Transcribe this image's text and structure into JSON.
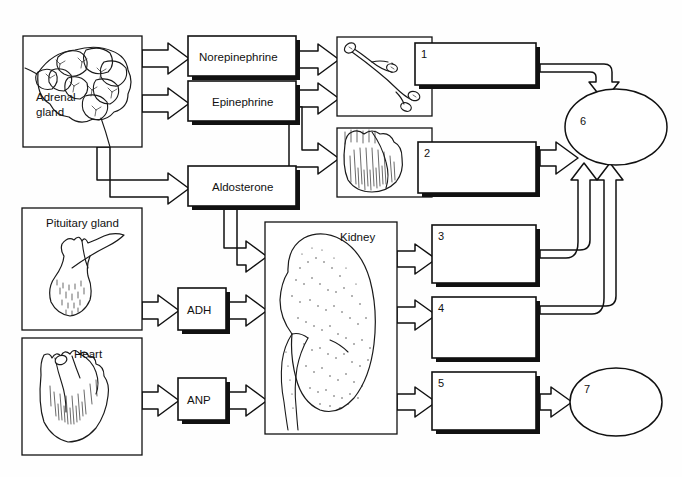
{
  "diagram": {
    "background": "#ffffff",
    "ink": "#111111"
  },
  "organs": [
    {
      "id": "adrenal-gland",
      "label": "Adrenal\ngland",
      "line1": "Adrenal",
      "line2": "gland",
      "icon": "adrenal-gland-icon"
    },
    {
      "id": "pituitary-gland",
      "label": "Pituitary gland",
      "icon": "pituitary-gland-icon"
    },
    {
      "id": "heart",
      "label": "Heart",
      "icon": "heart-icon"
    },
    {
      "id": "blood-vessel",
      "label": "",
      "icon": "blood-vessel-icon"
    },
    {
      "id": "heart-target",
      "label": "",
      "icon": "heart-muscle-icon"
    },
    {
      "id": "kidney",
      "label": "Kidney",
      "icon": "kidney-icon"
    }
  ],
  "hormones": [
    {
      "id": "norepinephrine",
      "label": "Norepinephrine"
    },
    {
      "id": "epinephrine",
      "label": "Epinephrine"
    },
    {
      "id": "aldosterone",
      "label": "Aldosterone"
    },
    {
      "id": "adh",
      "label": "ADH"
    },
    {
      "id": "anp",
      "label": "ANP"
    }
  ],
  "answer_boxes": [
    {
      "id": "answer-1",
      "number": "1",
      "value": ""
    },
    {
      "id": "answer-2",
      "number": "2",
      "value": ""
    },
    {
      "id": "answer-3",
      "number": "3",
      "value": ""
    },
    {
      "id": "answer-4",
      "number": "4",
      "value": ""
    },
    {
      "id": "answer-5",
      "number": "5",
      "value": ""
    }
  ],
  "answer_ellipses": [
    {
      "id": "answer-6",
      "number": "6",
      "value": ""
    },
    {
      "id": "answer-7",
      "number": "7",
      "value": ""
    }
  ],
  "labels": {
    "adrenal_line1": "Adrenal",
    "adrenal_line2": "gland",
    "pituitary": "Pituitary gland",
    "heart": "Heart",
    "kidney": "Kidney",
    "norepinephrine": "Norepinephrine",
    "epinephrine": "Epinephrine",
    "aldosterone": "Aldosterone",
    "adh": "ADH",
    "anp": "ANP",
    "n1": "1",
    "n2": "2",
    "n3": "3",
    "n4": "4",
    "n5": "5",
    "n6": "6",
    "n7": "7"
  }
}
